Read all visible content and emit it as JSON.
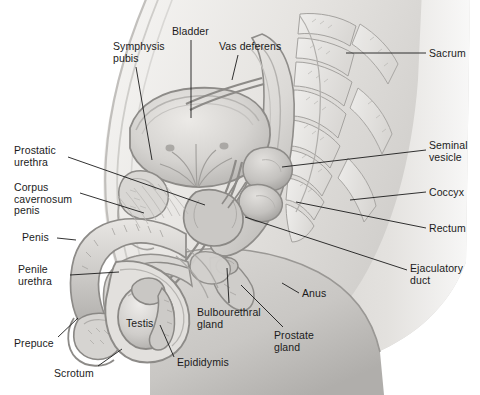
{
  "figure": {
    "type": "anatomical-illustration",
    "view": "midsagittal",
    "style": "grayscale medical illustration",
    "canvas": {
      "width": 480,
      "height": 395
    },
    "palette": {
      "background": "#ffffff",
      "body_light": "#e9e8e6",
      "body_mid": "#d2d0cd",
      "body_shadow": "#b5b3b0",
      "organ_light": "#dcdad7",
      "organ_mid": "#c3c1be",
      "organ_dark": "#a5a3a0",
      "outline": "#8d8b88",
      "outline_dark": "#6e6c69",
      "leader_line": "#1b1b1b",
      "label_text": "#1b1b1b"
    }
  },
  "labels": [
    {
      "id": "bladder",
      "text": "Bladder",
      "x": 172,
      "y": 26,
      "align": "left",
      "lines": [
        "Bladder"
      ],
      "leader": [
        [
          191,
          40
        ],
        [
          191,
          118
        ]
      ]
    },
    {
      "id": "symphysis-pubis",
      "text": "Symphysis pubis",
      "x": 113,
      "y": 41,
      "align": "left",
      "lines": [
        "Symphysis",
        "pubis"
      ],
      "leader": [
        [
          136,
          67
        ],
        [
          152,
          160
        ]
      ]
    },
    {
      "id": "vas-deferens",
      "text": "Vas deferens",
      "x": 219,
      "y": 41,
      "align": "left",
      "lines": [
        "Vas deferens"
      ],
      "leader": [
        [
          238,
          55
        ],
        [
          232,
          80
        ]
      ]
    },
    {
      "id": "sacrum",
      "text": "Sacrum",
      "x": 429,
      "y": 48,
      "align": "left",
      "lines": [
        "Sacrum"
      ],
      "leader": [
        [
          426,
          53
        ],
        [
          346,
          53
        ]
      ]
    },
    {
      "id": "prostatic-urethra",
      "text": "Prostatic urethra",
      "x": 14,
      "y": 145,
      "align": "left",
      "lines": [
        "Prostatic",
        "urethra"
      ],
      "leader": [
        [
          68,
          157
        ],
        [
          205,
          205
        ]
      ]
    },
    {
      "id": "seminal-vesicle",
      "text": "Seminal vesicle",
      "x": 429,
      "y": 140,
      "align": "left",
      "lines": [
        "Seminal",
        "vesicle"
      ],
      "leader": [
        [
          426,
          150
        ],
        [
          282,
          167
        ]
      ]
    },
    {
      "id": "corpus-cavernosum",
      "text": "Corpus cavernosum penis",
      "x": 14,
      "y": 182,
      "align": "left",
      "lines": [
        "Corpus",
        "cavernosum",
        "penis"
      ],
      "leader": [
        [
          80,
          193
        ],
        [
          144,
          213
        ]
      ]
    },
    {
      "id": "coccyx",
      "text": "Coccyx",
      "x": 429,
      "y": 187,
      "align": "left",
      "lines": [
        "Coccyx"
      ],
      "leader": [
        [
          426,
          192
        ],
        [
          350,
          200
        ]
      ]
    },
    {
      "id": "rectum",
      "text": "Rectum",
      "x": 429,
      "y": 223,
      "align": "left",
      "lines": [
        "Rectum"
      ],
      "leader": [
        [
          426,
          228
        ],
        [
          296,
          202
        ]
      ]
    },
    {
      "id": "penis",
      "text": "Penis",
      "x": 22,
      "y": 232,
      "align": "left",
      "lines": [
        "Penis"
      ],
      "leader": [
        [
          57,
          238
        ],
        [
          76,
          240
        ]
      ]
    },
    {
      "id": "penile-urethra",
      "text": "Penile urethra",
      "x": 18,
      "y": 264,
      "align": "left",
      "lines": [
        "Penile",
        "urethra"
      ],
      "leader": [
        [
          70,
          275
        ],
        [
          119,
          272
        ]
      ]
    },
    {
      "id": "ejaculatory-duct",
      "text": "Ejaculatory duct",
      "x": 410,
      "y": 263,
      "align": "left",
      "lines": [
        "Ejaculatory",
        "duct"
      ],
      "leader": [
        [
          407,
          270
        ],
        [
          245,
          217
        ]
      ]
    },
    {
      "id": "anus",
      "text": "Anus",
      "x": 302,
      "y": 288,
      "align": "left",
      "lines": [
        "Anus"
      ],
      "leader": [
        [
          299,
          293
        ],
        [
          282,
          283
        ]
      ]
    },
    {
      "id": "bulbourethral-gland",
      "text": "Bulbourethral gland",
      "x": 197,
      "y": 307,
      "align": "left",
      "lines": [
        "Bulbourethral",
        "gland"
      ],
      "leader": [
        [
          229,
          303
        ],
        [
          227,
          268
        ]
      ]
    },
    {
      "id": "testis",
      "text": "Testis",
      "x": 126,
      "y": 318,
      "align": "left",
      "lines": [
        "Testis"
      ],
      "leader": null
    },
    {
      "id": "prostate-gland",
      "text": "Prostate gland",
      "x": 274,
      "y": 330,
      "align": "left",
      "lines": [
        "Prostate",
        "gland"
      ],
      "leader": [
        [
          283,
          327
        ],
        [
          241,
          285
        ]
      ]
    },
    {
      "id": "prepuce",
      "text": "Prepuce",
      "x": 14,
      "y": 338,
      "align": "left",
      "lines": [
        "Prepuce"
      ],
      "leader": [
        [
          58,
          337
        ],
        [
          78,
          318
        ]
      ]
    },
    {
      "id": "scrotum",
      "text": "Scrotum",
      "x": 54,
      "y": 368,
      "align": "left",
      "lines": [
        "Scrotum"
      ],
      "leader": [
        [
          98,
          366
        ],
        [
          122,
          349
        ]
      ]
    },
    {
      "id": "epididymis",
      "text": "Epididymis",
      "x": 177,
      "y": 357,
      "align": "left",
      "lines": [
        "Epididymis"
      ],
      "leader": [
        [
          174,
          357
        ],
        [
          160,
          325
        ]
      ]
    }
  ],
  "structures": [
    "Bladder",
    "Symphysis pubis",
    "Vas deferens",
    "Sacrum",
    "Prostatic urethra",
    "Seminal vesicle",
    "Corpus cavernosum penis",
    "Coccyx",
    "Rectum",
    "Penis",
    "Penile urethra",
    "Ejaculatory duct",
    "Anus",
    "Bulbourethral gland",
    "Testis",
    "Prostate gland",
    "Prepuce",
    "Scrotum",
    "Epididymis"
  ]
}
